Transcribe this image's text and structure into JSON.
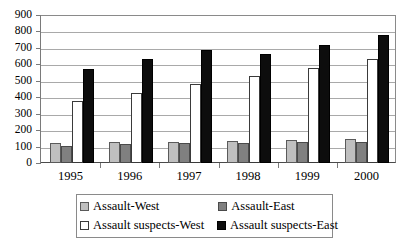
{
  "chart_data": {
    "type": "bar",
    "title": "",
    "subtitle": "",
    "xlabel": "",
    "ylabel": "",
    "categories": [
      "1995",
      "1996",
      "1997",
      "1998",
      "1999",
      "2000"
    ],
    "series": [
      {
        "name": "Assault-West",
        "color": "#bfbfbf",
        "values": [
          120,
          125,
          130,
          135,
          140,
          145
        ]
      },
      {
        "name": "Assault-East",
        "color": "#808080",
        "values": [
          105,
          115,
          120,
          122,
          130,
          125
        ]
      },
      {
        "name": "Assault suspects-West",
        "color": "#ffffff",
        "values": [
          375,
          425,
          480,
          530,
          575,
          630
        ]
      },
      {
        "name": "Assault suspects-East",
        "color": "#0d0d0d",
        "values": [
          570,
          630,
          690,
          660,
          715,
          780
        ]
      }
    ],
    "ylim": [
      0,
      900
    ],
    "ytick_step": 100,
    "ytick_labels": [
      "900",
      "800",
      "700",
      "600",
      "500",
      "400",
      "300",
      "200",
      "100",
      "0"
    ],
    "grid": true,
    "legend_position": "bottom"
  },
  "legend": {
    "items": [
      {
        "label": "Assault-West"
      },
      {
        "label": "Assault-East"
      },
      {
        "label": "Assault suspects-West"
      },
      {
        "label": "Assault suspects-East"
      }
    ]
  }
}
